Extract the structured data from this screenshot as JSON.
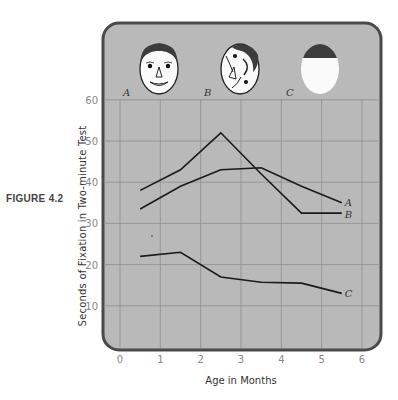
{
  "figure_label": "FIGURE 4.2",
  "chart_data": {
    "type": "line",
    "title": "",
    "xlabel": "Age in Months",
    "ylabel": "Seconds of Fixation in Two-minute Test",
    "xlim": [
      0,
      6
    ],
    "ylim": [
      0,
      60
    ],
    "x_ticks": [
      "0",
      "1",
      "2",
      "3",
      "4",
      "5",
      "6"
    ],
    "y_ticks": [
      "10",
      "20",
      "30",
      "40",
      "50",
      "60"
    ],
    "grid": true,
    "x": [
      0.5,
      1.5,
      2.5,
      3.5,
      4.5,
      5.5
    ],
    "series": [
      {
        "name": "A",
        "values": [
          33.5,
          39,
          43,
          43.5,
          39,
          35
        ]
      },
      {
        "name": "B",
        "values": [
          38,
          43,
          52,
          42,
          32.5,
          32.5
        ]
      },
      {
        "name": "C",
        "values": [
          22,
          23,
          17,
          15.7,
          15.5,
          13
        ]
      }
    ],
    "stimuli": [
      {
        "label": "A",
        "description": "normal face"
      },
      {
        "label": "B",
        "description": "scrambled face features"
      },
      {
        "label": "C",
        "description": "blank oval with dark top"
      }
    ]
  },
  "colors": {
    "panel_fill": "#b9b9b9",
    "panel_border": "#4a4a4a",
    "grid": "#8e8e8e",
    "line": "#1a1a1a",
    "hair": "#3c3c3c"
  }
}
